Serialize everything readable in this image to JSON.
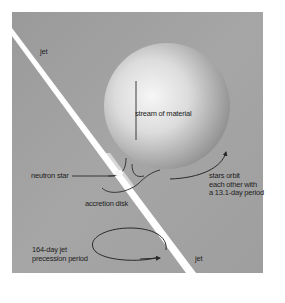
{
  "diagram": {
    "colors": {
      "page_background": "#ffffff",
      "panel_gray": "#9c9c9c",
      "jet": "#ffffff",
      "star_highlight": "#f4f4f4",
      "star_shadow": "#8e8e8e",
      "line": "#2a2a2a",
      "text": "#1e1e1e"
    },
    "labels": {
      "jet_top": "jet",
      "jet_bottom": "jet",
      "stream": "stream of material",
      "neutron_star": "neutron star",
      "accretion_disk": "accretion disk",
      "orbit": "stars orbit\neach other with\na 13.1-day period",
      "precession": "164-day jet\nprecession period"
    },
    "values": {
      "orbital_period_days": 13.1,
      "jet_precession_period_days": 164
    }
  }
}
